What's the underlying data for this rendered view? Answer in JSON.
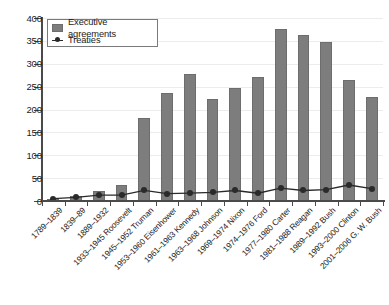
{
  "chart_data": {
    "type": "bar",
    "title": "",
    "subtitle": "",
    "xlabel": "",
    "ylabel": "",
    "ylim": [
      0,
      400
    ],
    "ytick_step": 50,
    "yticks": [
      0,
      50,
      100,
      150,
      200,
      250,
      300,
      350,
      400
    ],
    "grid": true,
    "legend_position": "top-left",
    "categories": [
      "1789–1839",
      "1839–89",
      "1889–1932",
      "1933–1945 Roosevelt",
      "1945–1952 Truman",
      "1953–1960 Eisenhower",
      "1961–1963 Kennedy",
      "1963–1968 Johnson",
      "1969–1974 Nixon",
      "1974–1976 Ford",
      "1977–1980 Carter",
      "1981–1988 Reagan",
      "1989–1992 Bush",
      "1993–2000 Clinton",
      "2001–2006 G. W. Bush"
    ],
    "series": [
      {
        "name": "Executive agreements",
        "type": "bar",
        "color": "#7d7d7d",
        "values": [
          4,
          10,
          22,
          34,
          181,
          236,
          277,
          223,
          246,
          272,
          375,
          362,
          347,
          264,
          227
        ]
      },
      {
        "name": "Treaties",
        "type": "line",
        "color": "#2a2a2a",
        "values": [
          5,
          8,
          13,
          13,
          23,
          16,
          17,
          19,
          23,
          17,
          28,
          23,
          25,
          35,
          27
        ]
      }
    ]
  },
  "legend": {
    "items": [
      {
        "label": "Executive agreements",
        "marker": "bar-swatch"
      },
      {
        "label": "Treaties",
        "marker": "line-dot"
      }
    ]
  },
  "colors": {
    "bar_fill": "#7d7d7d",
    "bar_stroke": "#6d6d6d",
    "line_color": "#2a2a2a",
    "axis": "#4a4a4a",
    "gridline": "#ececec",
    "background": "#ffffff",
    "text": "#1c1c1c"
  }
}
